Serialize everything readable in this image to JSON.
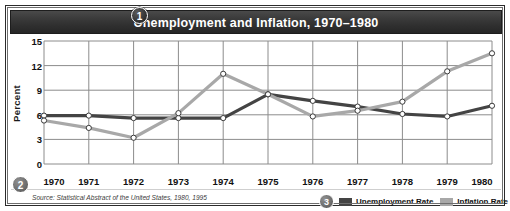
{
  "figure": {
    "title": "Unemployment and Inflation, 1970–1980",
    "source": "Source: Statistical Abstract of the United States, 1980, 1995",
    "badges": {
      "title_badge": "1",
      "source_badge": "2",
      "legend_badge": "3"
    }
  },
  "colors": {
    "title_bar_dark": "#2e2e2e",
    "title_text": "#ffffff",
    "frame": "#2b2b2b",
    "unemployment": "#444444",
    "inflation": "#a8a8a8",
    "gridline": "#8c8c8c",
    "plot_background": "#ffffff",
    "marker_fill": "#ffffff"
  },
  "legend": {
    "items": [
      {
        "label": "Unemployment Rate",
        "color": "#444444",
        "swatch": "dark-gray-square"
      },
      {
        "label": "Inflation Rate",
        "color": "#a8a8a8",
        "swatch": "light-gray-square"
      }
    ]
  },
  "chart_data": {
    "type": "line",
    "title": "Unemployment and Inflation, 1970–1980",
    "xlabel": "",
    "ylabel": "Percent",
    "x": [
      1970,
      1971,
      1972,
      1973,
      1974,
      1975,
      1976,
      1977,
      1978,
      1979,
      1980
    ],
    "categories": [
      "1970",
      "1971",
      "1972",
      "1973",
      "1974",
      "1975",
      "1976",
      "1977",
      "1978",
      "1979",
      "1980"
    ],
    "xticklabels": [
      "1970",
      "1971",
      "1972",
      "1973",
      "1974",
      "1975",
      "1976",
      "1977",
      "1978",
      "1979",
      "1980"
    ],
    "yticks": [
      0,
      3,
      6,
      9,
      12,
      15
    ],
    "yticklabels": [
      "0",
      "3",
      "6",
      "9",
      "12",
      "15"
    ],
    "ylim": [
      0,
      15
    ],
    "xlim": [
      1970,
      1980
    ],
    "grid": true,
    "legend_position": "bottom-right",
    "markers": "open-circle",
    "series": [
      {
        "name": "Unemployment Rate",
        "color": "#444444",
        "values": [
          5.9,
          5.9,
          5.6,
          5.6,
          5.6,
          8.5,
          7.7,
          7.0,
          6.1,
          5.8,
          7.1
        ]
      },
      {
        "name": "Inflation Rate",
        "color": "#a8a8a8",
        "values": [
          5.3,
          4.4,
          3.2,
          6.2,
          11.0,
          8.5,
          5.8,
          6.5,
          7.6,
          11.3,
          13.5
        ]
      }
    ]
  }
}
